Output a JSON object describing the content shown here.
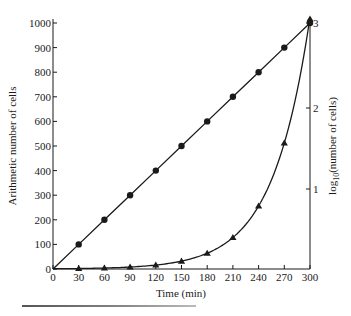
{
  "chart_data": {
    "type": "line",
    "title": "",
    "xlabel": "Time (min)",
    "ylabel": "Arithmetic number of cells",
    "ylabel_right": "log10(number of cells)",
    "x": [
      0,
      30,
      60,
      90,
      120,
      150,
      180,
      210,
      240,
      270,
      300
    ],
    "xlim": [
      0,
      300
    ],
    "ylim": [
      0,
      1000
    ],
    "ylim_right": [
      0,
      3
    ],
    "x_ticks": [
      "0",
      "30",
      "60",
      "90",
      "120",
      "150",
      "180",
      "210",
      "240",
      "270",
      "300"
    ],
    "y_ticks": [
      "0",
      "100",
      "200",
      "300",
      "400",
      "500",
      "600",
      "700",
      "800",
      "900",
      "1000"
    ],
    "y_ticks_right": [
      "1",
      "2",
      "3"
    ],
    "grid": false,
    "legend": null,
    "series": [
      {
        "name": "Arithmetic (linear) growth",
        "marker": "circle",
        "axis": "left",
        "values": [
          0,
          100,
          200,
          300,
          400,
          500,
          600,
          700,
          800,
          900,
          1000
        ]
      },
      {
        "name": "Exponential (doubling) growth",
        "marker": "triangle",
        "axis": "left",
        "values": [
          1,
          2,
          4,
          8,
          16,
          32,
          64,
          128,
          256,
          512,
          1024
        ]
      }
    ]
  },
  "labels": {
    "xlabel": "Time (min)",
    "ylabel_left": "Arithmetic number of cells",
    "ylabel_right_prefix": "log",
    "ylabel_right_sub": "10",
    "ylabel_right_suffix": "(number of cells)"
  },
  "colors": {
    "ink": "#1a1a1a",
    "background": "#ffffff"
  }
}
